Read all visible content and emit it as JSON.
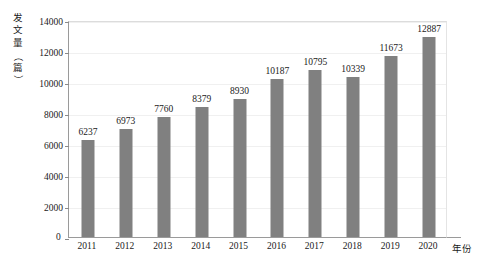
{
  "chart_data": {
    "type": "bar",
    "title": "",
    "xlabel": "年份",
    "ylabel": "发文量（篇）",
    "categories": [
      "2011",
      "2012",
      "2013",
      "2014",
      "2015",
      "2016",
      "2017",
      "2018",
      "2019",
      "2020"
    ],
    "values": [
      6237,
      6973,
      7760,
      8379,
      8930,
      10187,
      10795,
      10339,
      11673,
      12887
    ],
    "value_labels": [
      "6237",
      "6973",
      "7760",
      "8379",
      "8930",
      "10187",
      "10795",
      "10339",
      "11673",
      "12887"
    ],
    "ylim": [
      0,
      14000
    ],
    "ytick_labels": [
      "0",
      "2000",
      "4000",
      "6000",
      "8000",
      "10000",
      "12000",
      "14000"
    ],
    "ytick_values": [
      0,
      2000,
      4000,
      6000,
      8000,
      10000,
      12000,
      14000
    ],
    "grid": true,
    "legend": "none",
    "bar_color": "#808080",
    "axis_color": "#9a9a9a",
    "gridline_color": "#f0f0f0",
    "text_color": "#1a1a1a"
  },
  "y_axis_caption_chars": [
    "发",
    "文",
    "量",
    "（",
    "篇",
    "）"
  ],
  "origin_label": "0"
}
